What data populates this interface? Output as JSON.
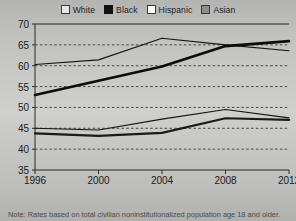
{
  "legend": {
    "items": [
      {
        "label": "White",
        "icon": "legend-swatch-white",
        "color": "#e8e8e6"
      },
      {
        "label": "Black",
        "icon": "legend-swatch-black",
        "color": "#111111"
      },
      {
        "label": "Hispanic",
        "icon": "legend-swatch-hispanic",
        "color": "#fbfbf9"
      },
      {
        "label": "Asian",
        "icon": "legend-swatch-asian",
        "color": "#8e8e8c"
      }
    ]
  },
  "note": {
    "text": "Note: Rates based on total civilian noninstitutionalized population age 18 and older."
  },
  "chart_data": {
    "type": "line",
    "title": "",
    "xlabel": "",
    "ylabel": "",
    "x": [
      1996,
      2000,
      2004,
      2008,
      2012
    ],
    "xtick_labels": [
      "1996",
      "2000",
      "2004",
      "2008",
      "2012"
    ],
    "ytick_labels": [
      "35",
      "40",
      "45",
      "50",
      "55",
      "60",
      "65",
      "70"
    ],
    "yticks": [
      35,
      40,
      45,
      50,
      55,
      60,
      65,
      70
    ],
    "xlim": [
      1996,
      2012
    ],
    "ylim": [
      35,
      70
    ],
    "grid": "horizontal-dashed",
    "legend_position": "top-center",
    "series": [
      {
        "name": "White",
        "values": [
          60.3,
          61.4,
          66.6,
          65.0,
          63.6
        ],
        "line_color": "#151515",
        "line_width": 1.1
      },
      {
        "name": "Black",
        "values": [
          53.0,
          56.4,
          59.8,
          64.7,
          65.9
        ],
        "line_color": "#0c0c0c",
        "line_width": 2.6
      },
      {
        "name": "Hispanic",
        "values": [
          45.0,
          44.6,
          47.2,
          49.5,
          47.5
        ],
        "line_color": "#151515",
        "line_width": 1.1
      },
      {
        "name": "Asian",
        "values": [
          43.8,
          43.2,
          43.9,
          47.4,
          47.0
        ],
        "line_color": "#1a1a1a",
        "line_width": 2.2
      }
    ]
  }
}
